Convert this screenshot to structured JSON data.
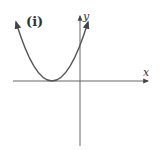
{
  "figure": {
    "panel_label": "(i)",
    "x_axis_label": "x",
    "y_axis_label": "y",
    "curve": "upward parabola with vertex on negative x-axis, tangent to x-axis",
    "colors": {
      "axis": "#555555",
      "curve": "#555555",
      "text": "#333333"
    }
  }
}
